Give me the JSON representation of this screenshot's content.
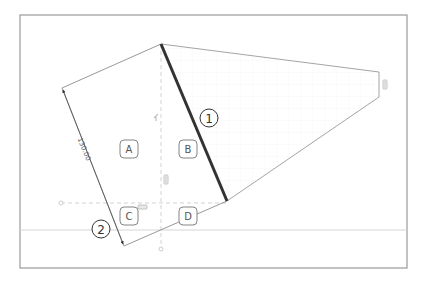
{
  "diagram": {
    "type": "cad-sketch",
    "frame": {
      "x": 20,
      "y": 15,
      "width": 387,
      "height": 253,
      "stroke": "#9a9a9a"
    },
    "horizontal_ground_line": {
      "y": 230,
      "color": "#d4d4d4"
    },
    "region_labels": [
      {
        "id": "A",
        "text": "A"
      },
      {
        "id": "B",
        "text": "B"
      },
      {
        "id": "C",
        "text": "C"
      },
      {
        "id": "D",
        "text": "D"
      }
    ],
    "callouts": [
      {
        "id": "1",
        "text": "1"
      },
      {
        "id": "2",
        "text": "2"
      }
    ],
    "dimension": {
      "value": "130.00",
      "orientation": "along-left-edge"
    },
    "highlighted_edge": {
      "color": "#333333",
      "from": [
        161,
        44
      ],
      "to": [
        227,
        201
      ]
    },
    "colors": {
      "outline": "#8c8c8c",
      "thick_edge": "#333333",
      "construction_line": "#c8c8c8",
      "label_border": "#777777",
      "constraint_marker": "#b5b5b5"
    }
  }
}
